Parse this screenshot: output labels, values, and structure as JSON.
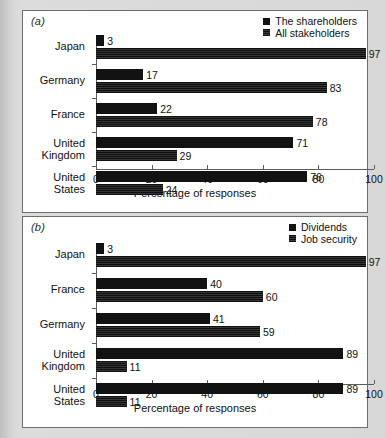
{
  "figure": {
    "background_color": "#d8d8d8",
    "panel_background": "#ffffff",
    "bar_color": "#121212"
  },
  "chart_data": [
    {
      "type": "bar",
      "orientation": "horizontal",
      "panel_label": "(a)",
      "title": "",
      "xlabel": "Percentage of responses",
      "ylabel": "",
      "xlim": [
        0,
        100
      ],
      "xticks": [
        0,
        20,
        40,
        60,
        80,
        100
      ],
      "xtick_labels": [
        "0",
        "20",
        "40",
        "60",
        "80",
        "100"
      ],
      "grid": false,
      "legend_position": "top-right",
      "categories": [
        "Japan",
        "Germany",
        "France",
        "United\nKingdom",
        "United\nStates"
      ],
      "series": [
        {
          "name": "The shareholders",
          "values": [
            3,
            17,
            22,
            71,
            76
          ]
        },
        {
          "name": "All stakeholders",
          "values": [
            97,
            83,
            78,
            29,
            24
          ]
        }
      ]
    },
    {
      "type": "bar",
      "orientation": "horizontal",
      "panel_label": "(b)",
      "title": "",
      "xlabel": "Percentage of responses",
      "ylabel": "",
      "xlim": [
        0,
        100
      ],
      "xticks": [
        0,
        20,
        40,
        60,
        80,
        100
      ],
      "xtick_labels": [
        "0",
        "20",
        "40",
        "60",
        "80",
        "100"
      ],
      "grid": false,
      "legend_position": "top-right",
      "categories": [
        "Japan",
        "France",
        "Germany",
        "United\nKingdom",
        "United\nStates"
      ],
      "series": [
        {
          "name": "Dividends",
          "values": [
            3,
            40,
            41,
            89,
            89
          ]
        },
        {
          "name": "Job security",
          "values": [
            97,
            60,
            59,
            11,
            11
          ]
        }
      ]
    }
  ]
}
